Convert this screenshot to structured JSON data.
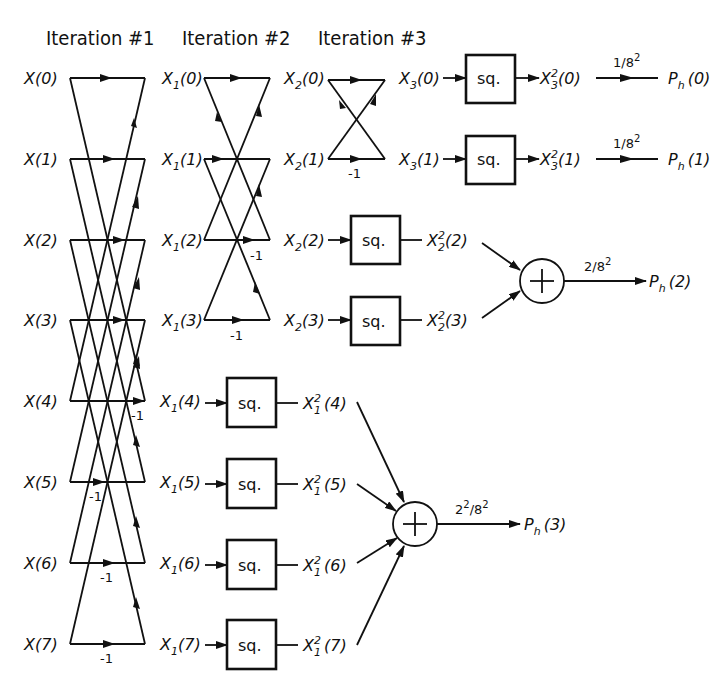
{
  "titles": {
    "iteration1": "Iteration #1",
    "iteration2": "Iteration #2",
    "iteration3": "Iteration #3"
  },
  "inputs": [
    "X(0)",
    "X(1)",
    "X(2)",
    "X(3)",
    "X(4)",
    "X(5)",
    "X(6)",
    "X(7)"
  ],
  "stage1_outputs": [
    "X1(0)",
    "X1(1)",
    "X1(2)",
    "X1(3)",
    "X1(4)",
    "X1(5)",
    "X1(6)",
    "X1(7)"
  ],
  "stage2_outputs": [
    "X2(0)",
    "X2(1)",
    "X2(2)",
    "X2(3)"
  ],
  "stage3_outputs": [
    "X3(0)",
    "X3(1)"
  ],
  "square_block_label": "sq.",
  "minus_one": "-1",
  "squared_signals": {
    "x3": [
      "X3²(0)",
      "X3²(1)"
    ],
    "x2": [
      "X2²(2)",
      "X2²(3)"
    ],
    "x1": [
      "X1²(4)",
      "X1²(5)",
      "X1²(6)",
      "X1²(7)"
    ]
  },
  "scale_factors": {
    "p0": "1/8²",
    "p1": "1/8²",
    "p2": "2/8²",
    "p3": "2²/8²"
  },
  "outputs": [
    "Ph(0)",
    "Ph(1)",
    "Ph(2)",
    "Ph(3)"
  ],
  "adder_symbol": "+",
  "text": {
    "x_letter": "X",
    "ph_letter": "P",
    "ph_sub": "h",
    "sq_sup": "2",
    "sub1": "1",
    "sub2": "2",
    "sub3": "3",
    "idx": [
      "(0)",
      "(1)",
      "(2)",
      "(3)",
      "(4)",
      "(5)",
      "(6)",
      "(7)"
    ],
    "sf1": "1/8",
    "sf2": "2/8",
    "sf3_base": "2",
    "sf3_rest": "/8",
    "sup2": "2"
  }
}
